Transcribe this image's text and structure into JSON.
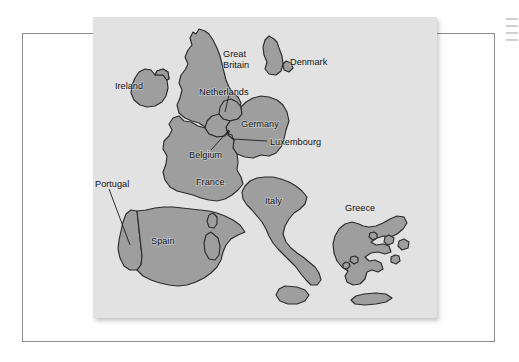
{
  "page": {
    "kind": "scanned-book-page",
    "background_color": "#ffffff",
    "frame_color": "#8e8e8e"
  },
  "map": {
    "title": "Map of Western Europe",
    "panel_background_color": "#e2e2e2",
    "land_fill_color": "#9e9e9e",
    "outline_color": "#2b2b2b",
    "labels": [
      {
        "name": "Great Britain",
        "text": "Great\nBritain",
        "line1": "Great",
        "line2": "Britain",
        "x": 130,
        "y": 33,
        "leader": false
      },
      {
        "name": "Ireland",
        "text": "Ireland",
        "x": 22,
        "y": 68,
        "leader": false
      },
      {
        "name": "Denmark",
        "text": "Denmark",
        "x": 197,
        "y": 42,
        "leader": false
      },
      {
        "name": "Netherlands",
        "text": "Netherlands",
        "x": 106,
        "y": 75,
        "leader": true
      },
      {
        "name": "Germany",
        "text": "Germany",
        "x": 148,
        "y": 106,
        "leader": false
      },
      {
        "name": "Luxembourg",
        "text": "Luxembourg",
        "x": 177,
        "y": 127,
        "leader": true
      },
      {
        "name": "Belgium",
        "text": "Belgium",
        "x": 96,
        "y": 137,
        "leader": true
      },
      {
        "name": "France",
        "text": "France",
        "x": 103,
        "y": 164,
        "leader": false
      },
      {
        "name": "Italy",
        "text": "Italy",
        "x": 172,
        "y": 183,
        "leader": false
      },
      {
        "name": "Portugal",
        "text": "Portugal",
        "x": 2,
        "y": 166,
        "leader": true
      },
      {
        "name": "Spain",
        "text": "Spain",
        "x": 58,
        "y": 223,
        "leader": false
      },
      {
        "name": "Greece",
        "text": "Greece",
        "x": 252,
        "y": 190,
        "leader": false
      }
    ]
  }
}
